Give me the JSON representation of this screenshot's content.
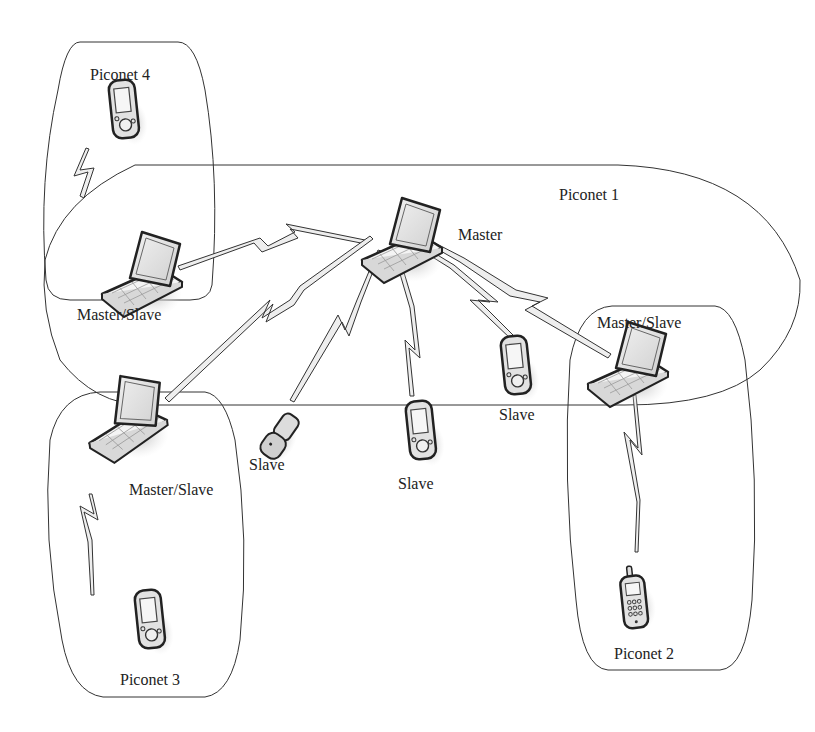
{
  "diagram": {
    "type": "bluetooth-scatternet",
    "piconets": [
      {
        "id": "piconet-1",
        "label": "Piconet 1"
      },
      {
        "id": "piconet-2",
        "label": "Piconet 2"
      },
      {
        "id": "piconet-3",
        "label": "Piconet 3"
      },
      {
        "id": "piconet-4",
        "label": "Piconet 4"
      }
    ],
    "nodes": [
      {
        "id": "master",
        "device": "laptop",
        "label": "Master"
      },
      {
        "id": "ms-left",
        "device": "laptop",
        "label": "Master/Slave"
      },
      {
        "id": "ms-bottom-left",
        "device": "laptop",
        "label": "Master/Slave"
      },
      {
        "id": "ms-right",
        "device": "laptop",
        "label": "Master/Slave"
      },
      {
        "id": "slave-flip",
        "device": "flip-phone",
        "label": "Slave"
      },
      {
        "id": "slave-pda-center",
        "device": "pda",
        "label": "Slave"
      },
      {
        "id": "slave-pda-right",
        "device": "pda",
        "label": "Slave"
      },
      {
        "id": "pda-piconet4",
        "device": "pda",
        "label": ""
      },
      {
        "id": "pda-piconet3",
        "device": "pda",
        "label": ""
      },
      {
        "id": "phone-piconet2",
        "device": "cell-phone",
        "label": ""
      }
    ],
    "links": [
      [
        "master",
        "ms-left"
      ],
      [
        "master",
        "ms-bottom-left"
      ],
      [
        "master",
        "slave-flip"
      ],
      [
        "master",
        "slave-pda-center"
      ],
      [
        "master",
        "slave-pda-right"
      ],
      [
        "master",
        "ms-right"
      ],
      [
        "ms-left",
        "pda-piconet4"
      ],
      [
        "ms-bottom-left",
        "pda-piconet3"
      ],
      [
        "ms-right",
        "phone-piconet2"
      ]
    ]
  },
  "labels": {
    "piconet1": "Piconet 1",
    "piconet2": "Piconet 2",
    "piconet3": "Piconet 3",
    "piconet4": "Piconet 4",
    "master": "Master",
    "ms_left": "Master/Slave",
    "ms_bottom_left": "Master/Slave",
    "ms_right": "Master/Slave",
    "slave_flip": "Slave",
    "slave_center": "Slave",
    "slave_right": "Slave"
  }
}
